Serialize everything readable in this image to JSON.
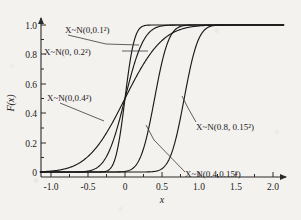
{
  "chart_data": {
    "type": "line",
    "title": "",
    "xlabel": "x",
    "ylabel": "F(x)",
    "xlim": [
      -1.15,
      2.15
    ],
    "ylim": [
      -0.05,
      1.06
    ],
    "grid": false,
    "legend_position": "inline-annotations",
    "x_ticks": [
      -1.0,
      -0.5,
      0,
      0.5,
      1.0,
      1.5,
      2.0
    ],
    "x_tick_labels": [
      "-1.0",
      "-0.5",
      "0",
      "0.5",
      "1.0",
      "1.5",
      "2.0"
    ],
    "y_ticks": [
      0,
      0.2,
      0.4,
      0.6,
      0.8,
      1.0
    ],
    "y_tick_labels": [
      "0",
      "0.2",
      "0.4",
      "0.6",
      "0.8",
      "1.0"
    ],
    "x_minor_ticks": [
      -0.75,
      -0.25,
      0.25,
      0.75,
      1.25,
      1.75
    ],
    "y_minor_ticks": [
      0.1,
      0.3,
      0.5,
      0.7,
      0.9
    ],
    "series": [
      {
        "name": "X~N(0,0.1^2)",
        "mu": 0,
        "sigma": 0.1,
        "color": "#1a1a1a"
      },
      {
        "name": "X~N(0,0.2^2)",
        "mu": 0,
        "sigma": 0.2,
        "color": "#1a1a1a"
      },
      {
        "name": "X~N(0,0.4^2)",
        "mu": 0,
        "sigma": 0.4,
        "color": "#1a1a1a"
      },
      {
        "name": "X~N(0.4,0.15^2)",
        "mu": 0.4,
        "sigma": 0.15,
        "color": "#1a1a1a"
      },
      {
        "name": "X~N(0.8,0.15^2)",
        "mu": 0.8,
        "sigma": 0.15,
        "color": "#1a1a1a"
      }
    ],
    "annotations": [
      {
        "id": "ann-n-0-01",
        "mean": "0",
        "sd": "0.1",
        "text_prefix": "X~N(",
        "text_mid": ", ",
        "text_suffix": ")",
        "exponent": "2"
      },
      {
        "id": "ann-n-0-02",
        "mean": "0",
        "sd": "0.2",
        "text_prefix": "X~N(",
        "text_mid": ", ",
        "text_suffix": ")",
        "exponent": "2"
      },
      {
        "id": "ann-n-0-04",
        "mean": "0",
        "sd": "0.4",
        "text_prefix": "X~N(",
        "text_mid": ", ",
        "text_suffix": ")",
        "exponent": "2"
      },
      {
        "id": "ann-n-04-015",
        "mean": "0.4",
        "sd": "0.15",
        "text_prefix": "X~N(",
        "text_mid": ", ",
        "text_suffix": ")",
        "exponent": "2"
      },
      {
        "id": "ann-n-08-015",
        "mean": "0.8",
        "sd": "0.15",
        "text_prefix": "X~N(",
        "text_mid": ", ",
        "text_suffix": ")",
        "exponent": "2"
      }
    ]
  },
  "labels": {
    "curve_1": "X~N(0,0.1²)",
    "curve_2": "X~N(0, 0.2²)",
    "curve_3": "X~N(0,0.4²)",
    "curve_4": "X~N(0.4,0.15²)",
    "curve_5": "X~N(0.8, 0.15²)",
    "x_axis": "x",
    "y_axis": "F(x)"
  },
  "ticks": {
    "x": [
      "-1.0",
      "-0.5",
      "0",
      "0.5",
      "1.0",
      "1.5",
      "2.0"
    ],
    "y": [
      "1.0",
      "0.8",
      "0.6",
      "0.4",
      "0.2",
      "0"
    ]
  },
  "colors": {
    "ink": "#1a1a1a",
    "paper": "#f4f2ef",
    "axis": "#2b2b2b"
  }
}
